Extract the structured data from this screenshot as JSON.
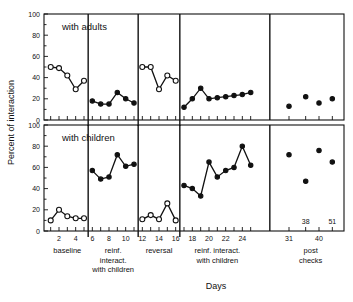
{
  "chart_data": {
    "type": "line",
    "title": "",
    "xlabel": "Days",
    "ylabel": "Percent of interaction",
    "ylim": [
      0,
      100
    ],
    "yticks": [
      0,
      20,
      40,
      60,
      80,
      100
    ],
    "xticks_labeled": [
      2,
      4,
      6,
      8,
      10,
      12,
      14,
      16,
      18,
      20,
      22,
      24,
      31,
      40
    ],
    "xtick_every": 1,
    "grid": false,
    "legend": "none",
    "panels": [
      {
        "name": "with adults",
        "label": "with adults",
        "series": [
          {
            "name": "baseline",
            "marker": "open-circle",
            "x": [
              1,
              2,
              3,
              4,
              5
            ],
            "values": [
              50,
              49,
              42,
              29,
              37
            ]
          },
          {
            "name": "reinf. interact. with children",
            "marker": "filled-circle",
            "x": [
              6,
              7,
              8,
              9,
              10,
              11
            ],
            "values": [
              18,
              15,
              15,
              26,
              20,
              16
            ]
          },
          {
            "name": "reversal",
            "marker": "open-circle",
            "x": [
              12,
              13,
              14,
              15,
              16
            ],
            "values": [
              50,
              50,
              29,
              42,
              37
            ]
          },
          {
            "name": "reinf. interact. with children 2",
            "marker": "filled-circle",
            "x": [
              17,
              18,
              19,
              20,
              21,
              22,
              23,
              24,
              25
            ],
            "values": [
              12,
              20,
              30,
              20,
              21,
              22,
              23,
              24,
              26
            ]
          },
          {
            "name": "post checks",
            "marker": "filled-circle-unconnected",
            "x": [
              31,
              36,
              40,
              44
            ],
            "values": [
              13,
              22,
              16,
              20
            ]
          }
        ]
      },
      {
        "name": "with children",
        "label": "with children",
        "series": [
          {
            "name": "baseline",
            "marker": "open-circle",
            "x": [
              1,
              2,
              3,
              4,
              5
            ],
            "values": [
              10,
              20,
              14,
              12,
              12
            ]
          },
          {
            "name": "reinf. interact. with children",
            "marker": "filled-circle",
            "x": [
              6,
              7,
              8,
              9,
              10,
              11
            ],
            "values": [
              57,
              49,
              51,
              72,
              61,
              63
            ]
          },
          {
            "name": "reversal",
            "marker": "open-circle",
            "x": [
              12,
              13,
              14,
              15,
              16
            ],
            "values": [
              11,
              15,
              11,
              26,
              10
            ]
          },
          {
            "name": "reinf. interact. with children 2",
            "marker": "filled-circle",
            "x": [
              17,
              18,
              19,
              20,
              21,
              22,
              23,
              24,
              25
            ],
            "values": [
              43,
              40,
              33,
              65,
              51,
              57,
              60,
              80,
              62
            ]
          },
          {
            "name": "post checks",
            "marker": "filled-circle-unconnected",
            "x": [
              31,
              36,
              40,
              44
            ],
            "values": [
              72,
              47,
              76,
              65
            ]
          }
        ]
      }
    ],
    "phases": [
      {
        "label": "baseline",
        "lines": [
          "baseline"
        ],
        "from": 1,
        "to": 5
      },
      {
        "label": "reinf. interact. with children",
        "lines": [
          "reinf.",
          "interact.",
          "with children"
        ],
        "from": 6,
        "to": 11
      },
      {
        "label": "reversal",
        "lines": [
          "reversal"
        ],
        "from": 12,
        "to": 16
      },
      {
        "label": "reinf. interact. with children",
        "lines": [
          "reinf. interact.",
          "with children"
        ],
        "from": 17,
        "to": 25
      },
      {
        "label": "post checks",
        "lines": [
          "post",
          "checks"
        ],
        "from": 31,
        "to": 44
      }
    ],
    "annotations": [
      {
        "text": "38",
        "near_x": 36,
        "panel": "with children"
      },
      {
        "text": "51",
        "near_x": 44,
        "panel": "with children"
      }
    ],
    "colors": {
      "ink": "#111111",
      "background": "#ffffff"
    }
  }
}
